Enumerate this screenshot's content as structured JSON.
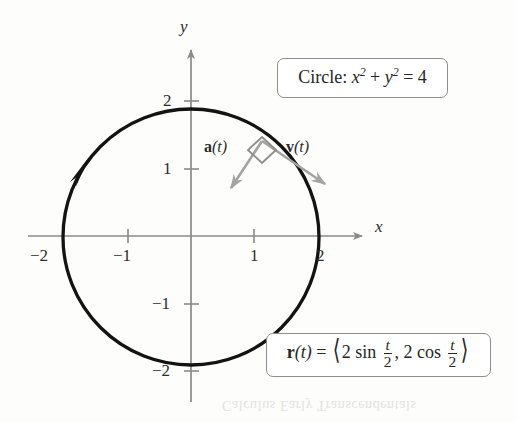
{
  "figure": {
    "background_color": "#fdfdfc"
  },
  "axes": {
    "x_label": "x",
    "y_label": "y",
    "axis_color": "#8a8a8a",
    "origin_px": {
      "x": 191,
      "y": 236
    },
    "unit_px": {
      "x": 63,
      "y": 68
    },
    "x_ticks": [
      {
        "value": -2,
        "label": "−2"
      },
      {
        "value": -1,
        "label": "−1"
      },
      {
        "value": 1,
        "label": "1"
      },
      {
        "value": 2,
        "label": "2"
      }
    ],
    "y_ticks": [
      {
        "value": 2,
        "label": "2"
      },
      {
        "value": 1,
        "label": "1"
      },
      {
        "value": -1,
        "label": "−1"
      },
      {
        "value": -2,
        "label": "−2"
      }
    ]
  },
  "curve": {
    "name": "circle",
    "color": "#111111",
    "radius_units": 2,
    "center_units": {
      "x": 0,
      "y": 0
    },
    "direction": "counterclockwise-arrowhead-upper-left",
    "stroke_width": 3.2
  },
  "vectors": {
    "color": "#9a9a9a",
    "origin_units": {
      "x": 1.12,
      "y": 1.52
    },
    "acceleration": {
      "label_bold": "a",
      "label_rest": "(t)",
      "label_text": "a(t)",
      "tip_units": {
        "x": 0.58,
        "y": 0.71
      }
    },
    "velocity": {
      "label_bold": "v",
      "label_rest": "(t)",
      "label_text": "v(t)",
      "tip_units": {
        "x": 2.2,
        "y": 0.73
      }
    },
    "right_angle_marker": true
  },
  "callouts": {
    "circle_equation": {
      "prefix": "Circle:",
      "x_var": "x",
      "y_var": "y",
      "exponent": "2",
      "plus": "+",
      "equals": "=",
      "value": "4",
      "plain_text": "Circle: x² + y² = 4"
    },
    "vector_function": {
      "fn_bold": "r",
      "fn_arg": "(t)",
      "equals": "=",
      "open_bracket": "⟨",
      "close_bracket": "⟩",
      "term1_coeff": "2",
      "term1_fn": "sin",
      "term1_num": "t",
      "term1_den": "2",
      "comma": ",",
      "term2_coeff": "2",
      "term2_fn": "cos",
      "term2_num": "t",
      "term2_den": "2",
      "plain_text": "r(t) = ⟨2 sin t/2, 2 cos t/2⟩"
    }
  },
  "bleed_text": "Calculus Early Transcendentals"
}
